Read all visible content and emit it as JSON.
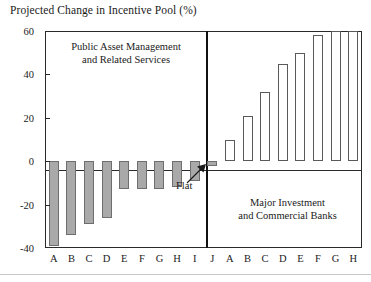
{
  "chart_data": {
    "type": "bar",
    "title": "Projected Change in Incentive Pool (%)",
    "xlabel": "",
    "ylabel": "",
    "ylim": [
      -40,
      60
    ],
    "yticks": [
      -40,
      -20,
      0,
      20,
      40,
      60
    ],
    "ytick_labels": [
      "-40",
      "-20",
      "0",
      "20",
      "40",
      "60"
    ],
    "grid": false,
    "legend": "none",
    "panels": [
      {
        "name": "Public Asset Management and Related Services",
        "label_line1": "Public Asset Management",
        "label_line2": "and Related Services",
        "categories": [
          "A",
          "B",
          "C",
          "D",
          "E",
          "F",
          "G",
          "H",
          "I",
          "J"
        ],
        "values": [
          -39,
          -34,
          -29,
          -26,
          -13,
          -13,
          -13,
          -12,
          -9,
          -2
        ],
        "bar_style": "gray-filled"
      },
      {
        "name": "Major Investment and Commercial Banks",
        "label_line1": "Major Investment",
        "label_line2": "and Commercial Banks",
        "categories": [
          "A",
          "B",
          "C",
          "D",
          "E",
          "F",
          "G",
          "H"
        ],
        "values": [
          10,
          21,
          32,
          45,
          50,
          58,
          60,
          60
        ],
        "bar_style": "white-outlined"
      }
    ],
    "annotations": [
      {
        "text": "Flat",
        "points_to": "panel1-category-J"
      }
    ]
  },
  "colors": {
    "negative_bar_fill": "#a9a9a9",
    "negative_bar_stroke": "#6e6e6e",
    "positive_bar_fill": "#ffffff",
    "positive_bar_stroke": "#5a5a5a",
    "axis": "#2a2a2a",
    "divider": "#111111",
    "background": "#ffffff"
  }
}
